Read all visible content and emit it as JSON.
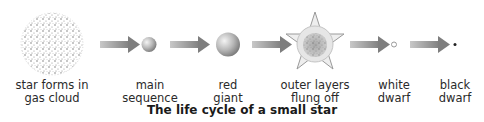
{
  "title": "The life cycle of a small star",
  "stages": [
    {
      "id": "gas-cloud",
      "label_line1": "star forms in",
      "label_line2": "gas cloud"
    },
    {
      "id": "main-sequence",
      "label_line1": "main",
      "label_line2": "sequence"
    },
    {
      "id": "red-giant",
      "label_line1": "red",
      "label_line2": "giant"
    },
    {
      "id": "outer-layers",
      "label_line1": "outer layers",
      "label_line2": "flung off"
    },
    {
      "id": "white-dwarf",
      "label_line1": "white",
      "label_line2": "dwarf"
    },
    {
      "id": "black-dwarf",
      "label_line1": "black",
      "label_line2": "dwarf"
    }
  ],
  "colors": {
    "arrow": "#8a8a8a",
    "sphere": "#b5b5b5",
    "text": "#2a2a2a"
  }
}
